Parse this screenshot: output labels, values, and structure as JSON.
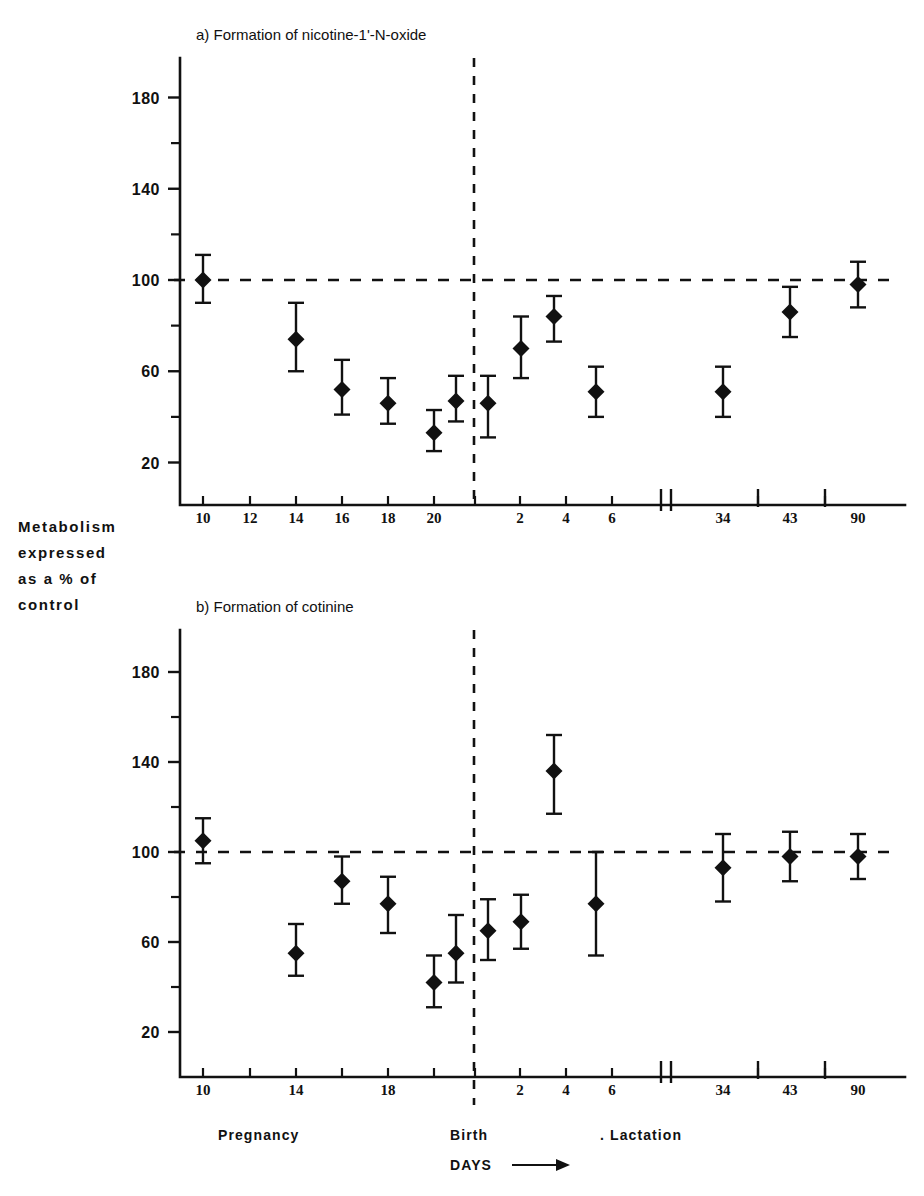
{
  "figure": {
    "y_axis_label_lines": [
      "Metabolism",
      "expressed",
      "as  a % of",
      "control"
    ],
    "x_axis_label": "DAYS",
    "arrow_icon": "right-arrow-icon",
    "period_labels": {
      "pregnancy": "Pregnancy",
      "birth": "Birth",
      "lactation": ". Lactation"
    }
  },
  "chart_data": [
    {
      "type": "scatter",
      "panel": "a",
      "title": "a) Formation of nicotine-1'-N-oxide",
      "xlabel": "DAYS",
      "ylabel": "Metabolism expressed as a % of control",
      "ylim": [
        0,
        200
      ],
      "yticks": [
        20,
        60,
        100,
        140,
        180
      ],
      "yticks_minor": [
        40,
        80,
        120,
        160
      ],
      "grid": false,
      "reference_line": 100,
      "xticks": [
        "10",
        "12",
        "14",
        "16",
        "18",
        "20",
        "2",
        "4",
        "6",
        "34",
        "43",
        "90"
      ],
      "axis_break": true,
      "points": [
        {
          "label": "10",
          "phase": "pregnancy",
          "x": 203,
          "value": 100,
          "err_low": 90,
          "err_high": 111
        },
        {
          "label": "14",
          "phase": "pregnancy",
          "x": 296,
          "value": 74,
          "err_low": 60,
          "err_high": 90
        },
        {
          "label": "16",
          "phase": "pregnancy",
          "x": 342,
          "value": 52,
          "err_low": 41,
          "err_high": 65
        },
        {
          "label": "18",
          "phase": "pregnancy",
          "x": 388,
          "value": 46,
          "err_low": 37,
          "err_high": 57
        },
        {
          "label": "20",
          "phase": "pregnancy",
          "x": 434,
          "value": 33,
          "err_low": 25,
          "err_high": 43
        },
        {
          "label": "21",
          "phase": "pregnancy",
          "x": 456,
          "value": 47,
          "err_low": 38,
          "err_high": 58
        },
        {
          "label": "1",
          "phase": "lactation",
          "x": 488,
          "value": 46,
          "err_low": 31,
          "err_high": 58
        },
        {
          "label": "2",
          "phase": "lactation",
          "x": 521,
          "value": 70,
          "err_low": 57,
          "err_high": 84
        },
        {
          "label": "3",
          "phase": "lactation",
          "x": 554,
          "value": 84,
          "err_low": 73,
          "err_high": 93
        },
        {
          "label": "5",
          "phase": "lactation",
          "x": 596,
          "value": 51,
          "err_low": 40,
          "err_high": 62
        },
        {
          "label": "34",
          "phase": "lactation",
          "x": 723,
          "value": 51,
          "err_low": 40,
          "err_high": 62
        },
        {
          "label": "43",
          "phase": "lactation",
          "x": 790,
          "value": 86,
          "err_low": 75,
          "err_high": 97
        },
        {
          "label": "90",
          "phase": "lactation",
          "x": 858,
          "value": 98,
          "err_low": 88,
          "err_high": 108
        }
      ]
    },
    {
      "type": "scatter",
      "panel": "b",
      "title": "b) Formation of cotinine",
      "xlabel": "DAYS",
      "ylabel": "Metabolism expressed as a % of control",
      "ylim": [
        0,
        200
      ],
      "yticks": [
        20,
        60,
        100,
        140,
        180
      ],
      "yticks_minor": [
        40,
        80,
        120,
        160
      ],
      "grid": false,
      "reference_line": 100,
      "xticks": [
        "10",
        "14",
        "18",
        "2",
        "4",
        "6",
        "34",
        "43",
        "90"
      ],
      "axis_break": true,
      "points": [
        {
          "label": "10",
          "phase": "pregnancy",
          "x": 203,
          "value": 105,
          "err_low": 95,
          "err_high": 115
        },
        {
          "label": "14",
          "phase": "pregnancy",
          "x": 296,
          "value": 55,
          "err_low": 45,
          "err_high": 68
        },
        {
          "label": "16",
          "phase": "pregnancy",
          "x": 342,
          "value": 87,
          "err_low": 77,
          "err_high": 98
        },
        {
          "label": "18",
          "phase": "pregnancy",
          "x": 388,
          "value": 77,
          "err_low": 64,
          "err_high": 89
        },
        {
          "label": "20",
          "phase": "pregnancy",
          "x": 434,
          "value": 42,
          "err_low": 31,
          "err_high": 54
        },
        {
          "label": "21",
          "phase": "pregnancy",
          "x": 456,
          "value": 55,
          "err_low": 42,
          "err_high": 72
        },
        {
          "label": "1",
          "phase": "lactation",
          "x": 488,
          "value": 65,
          "err_low": 52,
          "err_high": 79
        },
        {
          "label": "2",
          "phase": "lactation",
          "x": 521,
          "value": 69,
          "err_low": 57,
          "err_high": 81
        },
        {
          "label": "3",
          "phase": "lactation",
          "x": 554,
          "value": 136,
          "err_low": 117,
          "err_high": 152
        },
        {
          "label": "5",
          "phase": "lactation",
          "x": 596,
          "value": 77,
          "err_low": 54,
          "err_high": 100
        },
        {
          "label": "34",
          "phase": "lactation",
          "x": 723,
          "value": 93,
          "err_low": 78,
          "err_high": 108
        },
        {
          "label": "43",
          "phase": "lactation",
          "x": 790,
          "value": 98,
          "err_low": 87,
          "err_high": 109
        },
        {
          "label": "90",
          "phase": "lactation",
          "x": 858,
          "value": 98,
          "err_low": 88,
          "err_high": 108
        }
      ]
    }
  ]
}
